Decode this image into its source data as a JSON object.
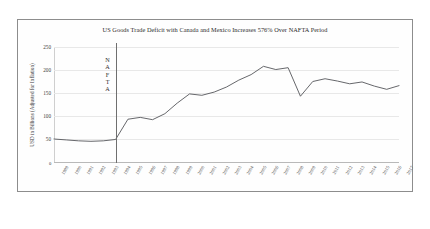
{
  "figure": {
    "title": "US Goods Trade Deficit with Canada and Mexico Increases 576% Over NAFTA Period",
    "ylabel": "USD in Billions (Adjusted for Inflation)",
    "origin_label": "0",
    "annotation": {
      "text": "NAFTA",
      "letters": [
        "N",
        "A",
        "F",
        "T",
        "A"
      ],
      "at_year": 1994
    },
    "line_color": "#55565a",
    "grid_color": "#e8e8e8",
    "frame_color": "#8d8d8d"
  },
  "chart_data": {
    "type": "line",
    "title": "US Goods Trade Deficit with Canada and Mexico Increases 576% Over NAFTA Period",
    "xlabel": "",
    "ylabel": "USD in Billions (Adjusted for Inflation)",
    "ylim": [
      0,
      250
    ],
    "yticks": [
      50,
      100,
      150,
      200,
      250
    ],
    "grid": true,
    "legend": "none",
    "x": [
      1989,
      1990,
      1991,
      1992,
      1993,
      1994,
      1995,
      1996,
      1997,
      1998,
      1999,
      2000,
      2001,
      2002,
      2003,
      2004,
      2005,
      2006,
      2007,
      2008,
      2009,
      2010,
      2011,
      2012,
      2013,
      2014,
      2015,
      2016,
      2017
    ],
    "categories": [
      "1989",
      "1990",
      "1991",
      "1992",
      "1993",
      "1994",
      "1995",
      "1996",
      "1997",
      "1998",
      "1999",
      "2000",
      "2001",
      "2002",
      "2003",
      "2004",
      "2005",
      "2006",
      "2007",
      "2008",
      "2009",
      "2010",
      "2011",
      "2012",
      "2013",
      "2014",
      "2015",
      "2016",
      "2017"
    ],
    "values": [
      50,
      48,
      46,
      45,
      46,
      49,
      93,
      97,
      92,
      105,
      128,
      148,
      145,
      152,
      163,
      178,
      190,
      208,
      201,
      205,
      143,
      175,
      181,
      176,
      170,
      174,
      165,
      158,
      166
    ],
    "series": [
      {
        "name": "US Goods Trade Deficit with Canada and Mexico",
        "values": [
          50,
          48,
          46,
          45,
          46,
          49,
          93,
          97,
          92,
          105,
          128,
          148,
          145,
          152,
          163,
          178,
          190,
          208,
          201,
          205,
          143,
          175,
          181,
          176,
          170,
          174,
          165,
          158,
          166
        ]
      }
    ],
    "annotations": [
      {
        "type": "vline",
        "x": 1994,
        "label": "NAFTA"
      }
    ]
  }
}
